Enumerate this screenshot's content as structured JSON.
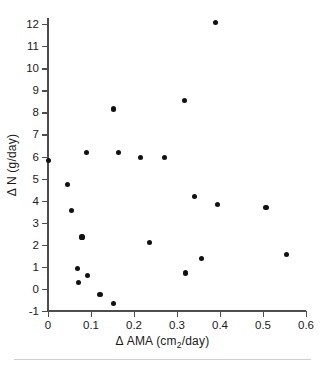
{
  "chart_data": {
    "type": "scatter",
    "title": "",
    "xlabel": "Δ AMA (cm2/day)",
    "ylabel": "Δ N (g/day)",
    "xlim": [
      0,
      0.6
    ],
    "ylim": [
      -1,
      12
    ],
    "grid": false,
    "legend": null,
    "xticks": [
      "0",
      "0.1",
      "0.2",
      "0.3",
      "0.4",
      "0.5",
      "0.6"
    ],
    "xtick_values": [
      0,
      0.1,
      0.2,
      0.3,
      0.4,
      0.5,
      0.6
    ],
    "yticks": [
      "12",
      "11",
      "10",
      "9",
      "8",
      "7",
      "6",
      "5",
      "4",
      "3",
      "2",
      "1",
      "0",
      "-1"
    ],
    "ytick_values": [
      12,
      11,
      10,
      9,
      8,
      7,
      6,
      5,
      4,
      3,
      2,
      1,
      0,
      -1
    ],
    "marker": "filled-circle",
    "marker_color": "#111111",
    "points": [
      {
        "x": 0.002,
        "y": 5.83
      },
      {
        "x": 0.046,
        "y": 4.73
      },
      {
        "x": 0.055,
        "y": 3.57
      },
      {
        "x": 0.068,
        "y": 0.94
      },
      {
        "x": 0.07,
        "y": 0.29
      },
      {
        "x": 0.079,
        "y": 2.35
      },
      {
        "x": 0.089,
        "y": 6.19
      },
      {
        "x": 0.091,
        "y": 0.62
      },
      {
        "x": 0.121,
        "y": -0.27
      },
      {
        "x": 0.152,
        "y": 8.15
      },
      {
        "x": 0.152,
        "y": -0.66
      },
      {
        "x": 0.164,
        "y": 6.18
      },
      {
        "x": 0.216,
        "y": 5.94
      },
      {
        "x": 0.236,
        "y": 2.1
      },
      {
        "x": 0.27,
        "y": 5.96
      },
      {
        "x": 0.317,
        "y": 8.55
      },
      {
        "x": 0.319,
        "y": 0.72
      },
      {
        "x": 0.341,
        "y": 4.19
      },
      {
        "x": 0.357,
        "y": 1.38
      },
      {
        "x": 0.389,
        "y": 12.05
      },
      {
        "x": 0.394,
        "y": 3.82
      },
      {
        "x": 0.507,
        "y": 3.7
      },
      {
        "x": 0.554,
        "y": 1.54
      }
    ]
  },
  "axis_titles": {
    "x_prefix": "Δ AMA (cm",
    "x_sub": "2",
    "x_suffix": "/day)",
    "y": "Δ N (g/day)"
  }
}
